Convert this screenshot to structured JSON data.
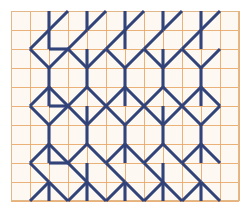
{
  "document": {
    "title": "Geometric Triangle Stitch Chart",
    "type": "needlework-pattern-chart",
    "description": "Counted thread pattern diagram on squared graph paper showing repeating triangle and chevron motifs worked in straight and diagonal stitches."
  },
  "canvas": {
    "width": 245,
    "height": 216,
    "background_color": "#ffffff"
  },
  "grid": {
    "name": "graph-paper-grid",
    "origin_x": 11,
    "origin_y": 11,
    "cell_size": 19,
    "columns": 12,
    "rows": 10,
    "line_color": "#e8a86a",
    "line_width": 0.9,
    "paper_color": "#fdf9f2",
    "border_color": "#e2b888",
    "border_width": 1
  },
  "stitching": {
    "name": "stitch-layer",
    "thread_color": "#32437a",
    "thread_highlight_color": "#4f5f92",
    "stitch_width": 3.1,
    "line_cap": "butt",
    "unit_label": "cell",
    "legend": {
      "straight_stitch_label": "vertical straight stitch (1 cell)",
      "diagonal_stitch_label": "diagonal stitch (1 x 1 cell)"
    }
  },
  "chart_data": {
    "type": "table",
    "xlabel": "grid column",
    "ylabel": "grid row",
    "grid": true,
    "legend": "none",
    "xlim": [
      0,
      12
    ],
    "ylim": [
      0,
      10
    ],
    "note": "Coordinates are grid-cell units measured from the top-left inner corner of the graph paper. Each stitch is listed as [x1, y1, x2, y2].",
    "vertical_stitches": [
      [
        2,
        0,
        2,
        1
      ],
      [
        2,
        1,
        2,
        2
      ],
      [
        2,
        3,
        2,
        4
      ],
      [
        2,
        4,
        2,
        5
      ],
      [
        2,
        6,
        2,
        7
      ],
      [
        2,
        7,
        2,
        8
      ],
      [
        2,
        9,
        2,
        10
      ],
      [
        4,
        0,
        4,
        1
      ],
      [
        4,
        2,
        4,
        3
      ],
      [
        4,
        3,
        4,
        4
      ],
      [
        4,
        5,
        4,
        6
      ],
      [
        4,
        6,
        4,
        7
      ],
      [
        4,
        8,
        4,
        9
      ],
      [
        4,
        9,
        4,
        10
      ],
      [
        6,
        0,
        6,
        1
      ],
      [
        6,
        1,
        6,
        2
      ],
      [
        6,
        3,
        6,
        4
      ],
      [
        6,
        4,
        6,
        5
      ],
      [
        6,
        6,
        6,
        7
      ],
      [
        6,
        7,
        6,
        8
      ],
      [
        6,
        9,
        6,
        10
      ],
      [
        8,
        0,
        8,
        1
      ],
      [
        8,
        2,
        8,
        3
      ],
      [
        8,
        3,
        8,
        4
      ],
      [
        8,
        5,
        8,
        6
      ],
      [
        8,
        6,
        8,
        7
      ],
      [
        8,
        8,
        8,
        9
      ],
      [
        8,
        9,
        8,
        10
      ],
      [
        10,
        0,
        10,
        1
      ],
      [
        10,
        1,
        10,
        2
      ],
      [
        10,
        3,
        10,
        4
      ],
      [
        10,
        4,
        10,
        5
      ],
      [
        10,
        6,
        10,
        7
      ],
      [
        10,
        7,
        10,
        8
      ],
      [
        10,
        9,
        10,
        10
      ]
    ],
    "diagonal_stitches": [
      [
        1,
        2,
        2,
        1
      ],
      [
        1,
        2,
        2,
        3
      ],
      [
        2,
        1,
        3,
        0
      ],
      [
        3,
        2,
        4,
        1
      ],
      [
        3,
        2,
        4,
        3
      ],
      [
        4,
        1,
        5,
        0
      ],
      [
        5,
        2,
        6,
        1
      ],
      [
        5,
        2,
        6,
        3
      ],
      [
        6,
        1,
        7,
        0
      ],
      [
        7,
        2,
        8,
        1
      ],
      [
        7,
        2,
        8,
        3
      ],
      [
        8,
        1,
        9,
        0
      ],
      [
        9,
        2,
        10,
        1
      ],
      [
        9,
        2,
        10,
        3
      ],
      [
        10,
        1,
        11,
        0
      ],
      [
        2,
        3,
        3,
        2
      ],
      [
        4,
        3,
        5,
        2
      ],
      [
        6,
        3,
        7,
        2
      ],
      [
        8,
        3,
        9,
        2
      ],
      [
        10,
        3,
        11,
        2
      ],
      [
        2,
        4,
        3,
        5
      ],
      [
        4,
        4,
        3,
        5
      ],
      [
        4,
        4,
        5,
        5
      ],
      [
        6,
        4,
        5,
        5
      ],
      [
        6,
        4,
        7,
        5
      ],
      [
        8,
        4,
        7,
        5
      ],
      [
        8,
        4,
        9,
        5
      ],
      [
        10,
        4,
        9,
        5
      ],
      [
        10,
        4,
        11,
        5
      ],
      [
        1,
        5,
        2,
        4
      ],
      [
        1,
        5,
        2,
        6
      ],
      [
        3,
        5,
        4,
        6
      ],
      [
        5,
        5,
        6,
        6
      ],
      [
        7,
        5,
        8,
        6
      ],
      [
        9,
        5,
        10,
        6
      ],
      [
        2,
        6,
        3,
        5
      ],
      [
        4,
        6,
        5,
        5
      ],
      [
        6,
        6,
        7,
        5
      ],
      [
        8,
        6,
        9,
        5
      ],
      [
        10,
        6,
        11,
        5
      ],
      [
        1,
        8,
        2,
        7
      ],
      [
        1,
        8,
        2,
        9
      ],
      [
        3,
        8,
        4,
        7
      ],
      [
        3,
        8,
        4,
        9
      ],
      [
        5,
        8,
        6,
        7
      ],
      [
        5,
        8,
        6,
        9
      ],
      [
        7,
        8,
        8,
        7
      ],
      [
        7,
        8,
        8,
        9
      ],
      [
        9,
        8,
        10,
        7
      ],
      [
        9,
        8,
        10,
        9
      ],
      [
        2,
        7,
        3,
        8
      ],
      [
        4,
        7,
        5,
        8
      ],
      [
        6,
        7,
        7,
        8
      ],
      [
        8,
        7,
        9,
        8
      ],
      [
        10,
        7,
        11,
        8
      ],
      [
        2,
        9,
        3,
        10
      ],
      [
        4,
        9,
        3,
        10
      ],
      [
        4,
        9,
        5,
        10
      ],
      [
        6,
        9,
        5,
        10
      ],
      [
        6,
        9,
        7,
        10
      ],
      [
        8,
        9,
        7,
        10
      ],
      [
        8,
        9,
        9,
        10
      ],
      [
        10,
        9,
        9,
        10
      ],
      [
        10,
        9,
        11,
        10
      ],
      [
        1,
        10,
        2,
        9
      ],
      [
        2,
        2,
        3,
        2
      ],
      [
        2,
        5,
        3,
        5
      ],
      [
        2,
        8,
        3,
        8
      ]
    ]
  }
}
